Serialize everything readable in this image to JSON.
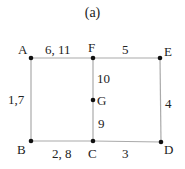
{
  "title": "(a)",
  "nodes": [
    {
      "id": "A",
      "label": "A"
    },
    {
      "id": "B",
      "label": "B"
    },
    {
      "id": "C",
      "label": "C"
    },
    {
      "id": "D",
      "label": "D"
    },
    {
      "id": "E",
      "label": "E"
    },
    {
      "id": "F",
      "label": "F"
    },
    {
      "id": "G",
      "label": "G"
    }
  ],
  "edges": [
    {
      "from": "A",
      "to": "F",
      "label": "6, 11"
    },
    {
      "from": "F",
      "to": "E",
      "label": "5"
    },
    {
      "from": "A",
      "to": "B",
      "label": "1,7"
    },
    {
      "from": "F",
      "to": "G",
      "label": "10"
    },
    {
      "from": "G",
      "to": "C",
      "label": "9"
    },
    {
      "from": "E",
      "to": "D",
      "label": "4"
    },
    {
      "from": "B",
      "to": "C",
      "label": "2, 8"
    },
    {
      "from": "C",
      "to": "D",
      "label": "3"
    }
  ],
  "colors": {
    "line": "#aaaaaa",
    "node": "#111111",
    "text": "#222222"
  }
}
